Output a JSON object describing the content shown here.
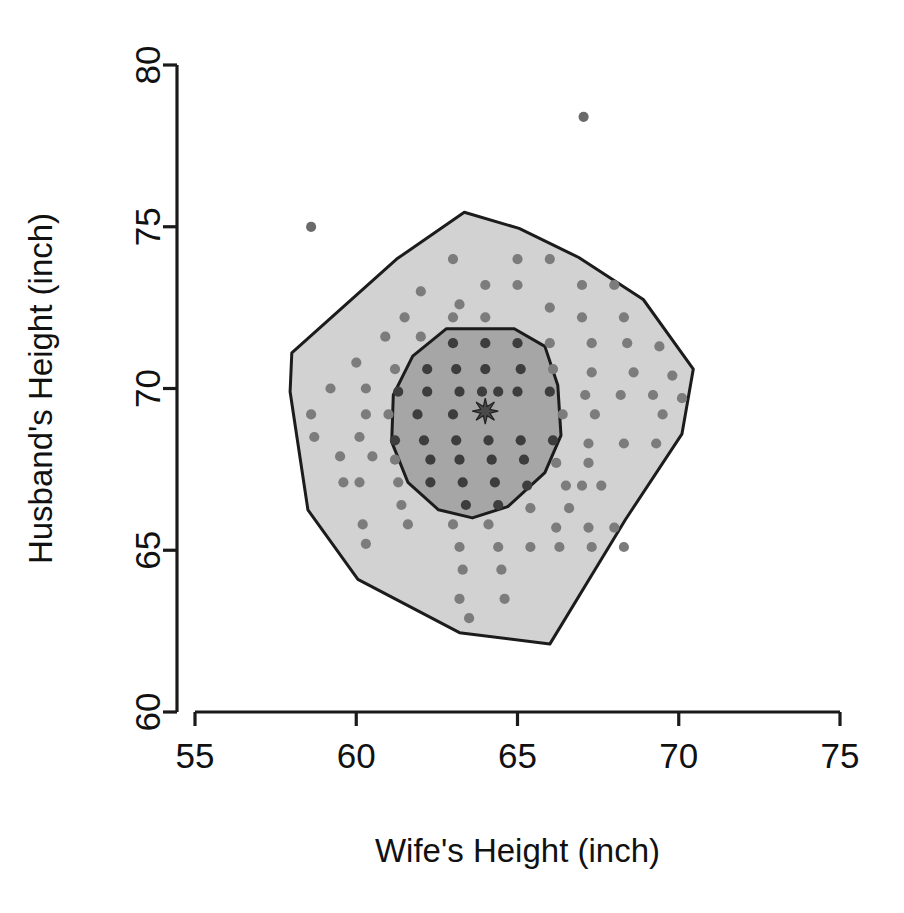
{
  "chart_data": {
    "type": "scatter",
    "subtype": "bagplot",
    "title": "",
    "xlabel": "Wife's Height (inch)",
    "ylabel": "Husband's Height (inch)",
    "xlim": [
      55,
      75
    ],
    "ylim": [
      60,
      80
    ],
    "xticks": [
      55,
      60,
      65,
      70,
      75
    ],
    "yticks": [
      60,
      65,
      70,
      75,
      80
    ],
    "xtick_labels": [
      "55",
      "60",
      "65",
      "70",
      "75"
    ],
    "ytick_labels": [
      "60",
      "65",
      "70",
      "75",
      "80"
    ],
    "grid": false,
    "legend": null,
    "colors": {
      "fence_fill": "#d2d2d2",
      "bag_fill": "#a6a6a6",
      "outline": "#1c1c1c",
      "point": "#7c7c7c",
      "point_inner": "#3d3d3d",
      "median": "#4a4a4a",
      "axis": "#1a1a1a",
      "background": "#ffffff"
    },
    "depth_median": {
      "x": 64.0,
      "y": 69.3,
      "marker": "star"
    },
    "bag_polygon": [
      [
        62.8,
        71.85
      ],
      [
        64.9,
        71.85
      ],
      [
        65.85,
        71.3
      ],
      [
        66.25,
        70.1
      ],
      [
        66.35,
        68.55
      ],
      [
        65.85,
        67.4
      ],
      [
        64.7,
        66.35
      ],
      [
        63.6,
        66.0
      ],
      [
        62.55,
        66.25
      ],
      [
        61.6,
        67.1
      ],
      [
        61.1,
        68.35
      ],
      [
        61.15,
        69.8
      ],
      [
        61.75,
        71.0
      ]
    ],
    "fence_polygon": [
      [
        63.35,
        75.45
      ],
      [
        65.05,
        74.95
      ],
      [
        66.9,
        74.05
      ],
      [
        68.9,
        72.75
      ],
      [
        70.45,
        70.6
      ],
      [
        70.1,
        68.6
      ],
      [
        68.35,
        65.95
      ],
      [
        66.0,
        62.1
      ],
      [
        63.2,
        62.45
      ],
      [
        60.05,
        64.1
      ],
      [
        58.5,
        66.25
      ],
      [
        57.95,
        69.9
      ],
      [
        58.0,
        71.1
      ],
      [
        61.25,
        74.0
      ]
    ],
    "outliers": [
      {
        "x": 58.6,
        "y": 75.0
      },
      {
        "x": 67.05,
        "y": 78.4
      }
    ],
    "points": [
      {
        "x": 63.0,
        "y": 74.0
      },
      {
        "x": 65.0,
        "y": 74.0
      },
      {
        "x": 66.0,
        "y": 74.0
      },
      {
        "x": 64.0,
        "y": 73.2
      },
      {
        "x": 65.0,
        "y": 73.2
      },
      {
        "x": 67.0,
        "y": 73.2
      },
      {
        "x": 68.0,
        "y": 73.2
      },
      {
        "x": 62.0,
        "y": 73.0
      },
      {
        "x": 63.2,
        "y": 72.6
      },
      {
        "x": 66.0,
        "y": 72.5
      },
      {
        "x": 61.5,
        "y": 72.2
      },
      {
        "x": 63.0,
        "y": 72.2
      },
      {
        "x": 64.0,
        "y": 72.2
      },
      {
        "x": 67.0,
        "y": 72.2
      },
      {
        "x": 68.3,
        "y": 72.2
      },
      {
        "x": 60.9,
        "y": 71.6
      },
      {
        "x": 62.0,
        "y": 71.6
      },
      {
        "x": 63.0,
        "y": 71.4
      },
      {
        "x": 64.0,
        "y": 71.4
      },
      {
        "x": 65.0,
        "y": 71.4
      },
      {
        "x": 66.0,
        "y": 71.4
      },
      {
        "x": 67.3,
        "y": 71.4
      },
      {
        "x": 68.4,
        "y": 71.4
      },
      {
        "x": 69.4,
        "y": 71.3
      },
      {
        "x": 60.0,
        "y": 70.8
      },
      {
        "x": 61.2,
        "y": 70.6
      },
      {
        "x": 62.2,
        "y": 70.6
      },
      {
        "x": 63.1,
        "y": 70.6
      },
      {
        "x": 64.0,
        "y": 70.6
      },
      {
        "x": 65.1,
        "y": 70.6
      },
      {
        "x": 66.1,
        "y": 70.6
      },
      {
        "x": 67.3,
        "y": 70.5
      },
      {
        "x": 68.6,
        "y": 70.5
      },
      {
        "x": 69.8,
        "y": 70.4
      },
      {
        "x": 59.2,
        "y": 70.0
      },
      {
        "x": 60.3,
        "y": 70.0
      },
      {
        "x": 61.3,
        "y": 69.9
      },
      {
        "x": 62.2,
        "y": 69.9
      },
      {
        "x": 63.2,
        "y": 69.9
      },
      {
        "x": 63.9,
        "y": 69.9
      },
      {
        "x": 64.4,
        "y": 69.9
      },
      {
        "x": 65.0,
        "y": 69.9
      },
      {
        "x": 66.0,
        "y": 69.9
      },
      {
        "x": 67.1,
        "y": 69.8
      },
      {
        "x": 68.2,
        "y": 69.8
      },
      {
        "x": 69.2,
        "y": 69.8
      },
      {
        "x": 70.1,
        "y": 69.7
      },
      {
        "x": 58.6,
        "y": 69.2
      },
      {
        "x": 60.3,
        "y": 69.2
      },
      {
        "x": 61.0,
        "y": 69.2
      },
      {
        "x": 61.9,
        "y": 69.2
      },
      {
        "x": 63.0,
        "y": 69.2
      },
      {
        "x": 66.4,
        "y": 69.2
      },
      {
        "x": 67.4,
        "y": 69.2
      },
      {
        "x": 69.5,
        "y": 69.2
      },
      {
        "x": 58.7,
        "y": 68.5
      },
      {
        "x": 60.1,
        "y": 68.5
      },
      {
        "x": 61.2,
        "y": 68.4
      },
      {
        "x": 62.1,
        "y": 68.4
      },
      {
        "x": 63.1,
        "y": 68.4
      },
      {
        "x": 64.1,
        "y": 68.4
      },
      {
        "x": 65.1,
        "y": 68.4
      },
      {
        "x": 66.1,
        "y": 68.4
      },
      {
        "x": 67.2,
        "y": 68.3
      },
      {
        "x": 68.3,
        "y": 68.3
      },
      {
        "x": 69.3,
        "y": 68.3
      },
      {
        "x": 59.5,
        "y": 67.9
      },
      {
        "x": 60.5,
        "y": 67.9
      },
      {
        "x": 61.2,
        "y": 67.8
      },
      {
        "x": 62.3,
        "y": 67.8
      },
      {
        "x": 63.2,
        "y": 67.8
      },
      {
        "x": 64.2,
        "y": 67.8
      },
      {
        "x": 65.2,
        "y": 67.8
      },
      {
        "x": 66.2,
        "y": 67.7
      },
      {
        "x": 67.2,
        "y": 67.7
      },
      {
        "x": 59.6,
        "y": 67.1
      },
      {
        "x": 60.1,
        "y": 67.1
      },
      {
        "x": 61.3,
        "y": 67.1
      },
      {
        "x": 62.3,
        "y": 67.1
      },
      {
        "x": 63.3,
        "y": 67.1
      },
      {
        "x": 64.3,
        "y": 67.1
      },
      {
        "x": 65.3,
        "y": 67.0
      },
      {
        "x": 66.5,
        "y": 67.0
      },
      {
        "x": 67.0,
        "y": 67.0
      },
      {
        "x": 67.6,
        "y": 67.0
      },
      {
        "x": 61.4,
        "y": 66.4
      },
      {
        "x": 63.4,
        "y": 66.4
      },
      {
        "x": 64.4,
        "y": 66.4
      },
      {
        "x": 65.4,
        "y": 66.3
      },
      {
        "x": 66.6,
        "y": 66.3
      },
      {
        "x": 60.2,
        "y": 65.8
      },
      {
        "x": 61.6,
        "y": 65.8
      },
      {
        "x": 63.0,
        "y": 65.8
      },
      {
        "x": 64.1,
        "y": 65.8
      },
      {
        "x": 66.2,
        "y": 65.7
      },
      {
        "x": 67.2,
        "y": 65.7
      },
      {
        "x": 68.0,
        "y": 65.7
      },
      {
        "x": 60.3,
        "y": 65.2
      },
      {
        "x": 63.2,
        "y": 65.1
      },
      {
        "x": 64.4,
        "y": 65.1
      },
      {
        "x": 65.4,
        "y": 65.1
      },
      {
        "x": 66.3,
        "y": 65.1
      },
      {
        "x": 67.3,
        "y": 65.1
      },
      {
        "x": 68.3,
        "y": 65.1
      },
      {
        "x": 63.3,
        "y": 64.4
      },
      {
        "x": 64.5,
        "y": 64.4
      },
      {
        "x": 63.2,
        "y": 63.5
      },
      {
        "x": 64.6,
        "y": 63.5
      },
      {
        "x": 63.5,
        "y": 62.9
      }
    ]
  },
  "figure": {
    "width": 904,
    "height": 913
  }
}
